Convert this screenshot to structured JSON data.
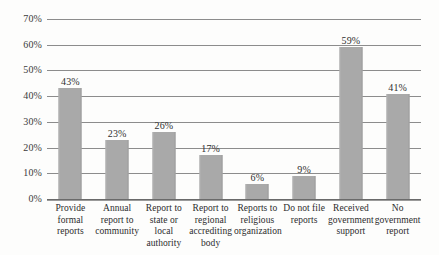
{
  "chart_data": {
    "type": "bar",
    "title": "",
    "subtitle": "",
    "xlabel": "",
    "ylabel": "",
    "ylim": [
      0,
      70
    ],
    "ytick_step": 10,
    "grid": true,
    "legend": false,
    "value_labels": true,
    "categories": [
      "Provide formal reports",
      "Annual report to community",
      "Report to state or local authority",
      "Report to regional accrediting body",
      "Reports to religious organization",
      "Do not file reports",
      "Received government support",
      "No government report"
    ],
    "values": [
      43,
      23,
      26,
      17,
      6,
      9,
      59,
      41
    ],
    "value_labels_text": [
      "43%",
      "23%",
      "26%",
      "17%",
      "6%",
      "9%",
      "59%",
      "41%"
    ],
    "ytick_labels": [
      "0%",
      "10%",
      "20%",
      "30%",
      "40%",
      "50%",
      "60%",
      "70%"
    ],
    "ytick_values": [
      0,
      10,
      20,
      30,
      40,
      50,
      60,
      70
    ],
    "colors": {
      "bar": "#a9a9a9",
      "gridline": "#8c8c8c",
      "axis": "#6a6a6a",
      "text": "#2c2c2c",
      "background": "#fdfdfc"
    }
  }
}
